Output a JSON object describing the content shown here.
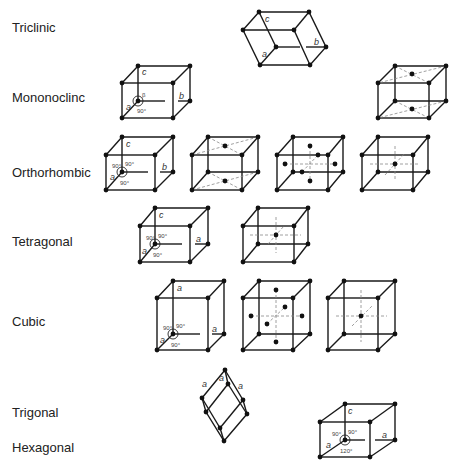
{
  "systems": [
    {
      "name": "Triclinic",
      "label_pos": [
        12,
        28
      ],
      "lattices": [
        "P"
      ]
    },
    {
      "name": "Mononoclinc",
      "label_pos": [
        12,
        98
      ],
      "lattices": [
        "P",
        "C"
      ]
    },
    {
      "name": "Orthorhombic",
      "label_pos": [
        12,
        172
      ],
      "lattices": [
        "P",
        "C",
        "F",
        "I"
      ]
    },
    {
      "name": "Tetragonal",
      "label_pos": [
        12,
        242
      ],
      "lattices": [
        "P",
        "I"
      ]
    },
    {
      "name": "Cubic",
      "label_pos": [
        12,
        322
      ],
      "lattices": [
        "P",
        "F",
        "I"
      ]
    },
    {
      "name": "Trigonal",
      "label_pos": [
        12,
        414
      ],
      "lattices": [
        "R"
      ]
    },
    {
      "name": "Hexagonal",
      "label_pos": [
        12,
        448
      ],
      "lattices": [
        "P"
      ]
    }
  ],
  "axis_labels": {
    "a": "a",
    "b": "b",
    "c": "c"
  },
  "angle_labels": {
    "alpha": "α",
    "beta": "β",
    "gamma": "γ",
    "right": "90°",
    "hex": "120°"
  }
}
